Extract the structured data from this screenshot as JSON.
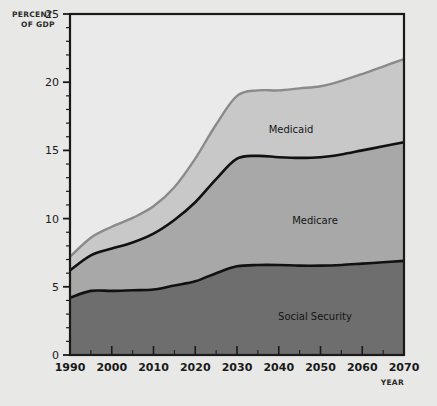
{
  "figure": {
    "background_color": "#e8e8e6",
    "plot_background_color": "#eaeaea"
  },
  "axes": {
    "y_axis_title_line1": "PERCENT",
    "y_axis_title_line2": "OF GDP",
    "x_axis_title": "YEAR",
    "y_ticks": [
      "0",
      "5",
      "10",
      "15",
      "20",
      "25"
    ],
    "x_ticks": [
      "1990",
      "2000",
      "2010",
      "2020",
      "2030",
      "2040",
      "2050",
      "2060",
      "2070"
    ]
  },
  "labels": {
    "medicaid": "Medicaid",
    "medicare": "Medicare",
    "social_security": "Social Security"
  },
  "chart_data": {
    "type": "area",
    "title": "",
    "subtitle": "",
    "xlabel": "YEAR",
    "ylabel": "PERCENT OF GDP",
    "xlim": [
      1990,
      2070
    ],
    "ylim": [
      0,
      25
    ],
    "grid": false,
    "legend_position": "inline-annotations",
    "stacked": true,
    "x": [
      1990,
      1995,
      2000,
      2005,
      2010,
      2015,
      2020,
      2025,
      2030,
      2035,
      2040,
      2045,
      2050,
      2055,
      2060,
      2065,
      2070
    ],
    "series": [
      {
        "name": "Social Security",
        "color": "#6e6e6e",
        "values": [
          4.2,
          4.7,
          4.7,
          4.75,
          4.8,
          5.1,
          5.4,
          6.0,
          6.5,
          6.6,
          6.6,
          6.55,
          6.55,
          6.6,
          6.7,
          6.8,
          6.9
        ]
      },
      {
        "name": "Medicare",
        "color": "#a8a8a8",
        "values": [
          2.0,
          2.6,
          3.1,
          3.5,
          4.1,
          4.8,
          5.8,
          6.9,
          7.9,
          8.0,
          7.9,
          7.9,
          7.95,
          8.1,
          8.3,
          8.5,
          8.7
        ]
      },
      {
        "name": "Medicaid",
        "color": "#c8c8c8",
        "values": [
          1.0,
          1.3,
          1.6,
          1.8,
          2.0,
          2.4,
          3.2,
          4.0,
          4.6,
          4.8,
          4.9,
          5.1,
          5.2,
          5.4,
          5.6,
          5.9,
          6.1
        ]
      }
    ],
    "cumulative": {
      "social_security_top": [
        4.2,
        4.7,
        4.7,
        4.75,
        4.8,
        5.1,
        5.4,
        6.0,
        6.5,
        6.6,
        6.6,
        6.55,
        6.55,
        6.6,
        6.7,
        6.8,
        6.9
      ],
      "medicare_top": [
        6.2,
        7.3,
        7.8,
        8.25,
        8.9,
        9.9,
        11.2,
        12.9,
        14.4,
        14.6,
        14.5,
        14.45,
        14.5,
        14.7,
        15.0,
        15.3,
        15.6
      ],
      "medicaid_top": [
        7.2,
        8.6,
        9.4,
        10.05,
        10.9,
        12.3,
        14.4,
        16.9,
        19.0,
        19.4,
        19.4,
        19.55,
        19.7,
        20.1,
        20.6,
        21.15,
        21.7
      ]
    }
  }
}
